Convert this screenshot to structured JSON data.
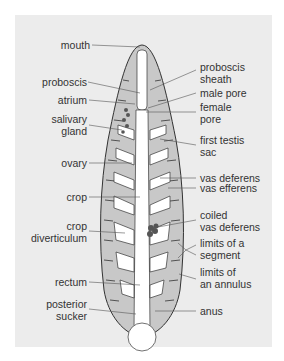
{
  "diagram": {
    "colors": {
      "background": "#ececec",
      "body": "#c8c8c8",
      "organs": "#ffffff",
      "outline": "#333333"
    },
    "left_labels": [
      {
        "id": "mouth",
        "line1": "mouth",
        "line2": ""
      },
      {
        "id": "proboscis",
        "line1": "proboscis",
        "line2": ""
      },
      {
        "id": "atrium",
        "line1": "atrium",
        "line2": ""
      },
      {
        "id": "salivary-gland",
        "line1": "salivary",
        "line2": "gland"
      },
      {
        "id": "ovary",
        "line1": "ovary",
        "line2": ""
      },
      {
        "id": "crop",
        "line1": "crop",
        "line2": ""
      },
      {
        "id": "crop-diverticulum",
        "line1": "crop",
        "line2": "diverticulum"
      },
      {
        "id": "rectum",
        "line1": "rectum",
        "line2": ""
      },
      {
        "id": "posterior-sucker",
        "line1": "posterior",
        "line2": "sucker"
      }
    ],
    "right_labels": [
      {
        "id": "proboscis-sheath",
        "line1": "proboscis",
        "line2": "sheath"
      },
      {
        "id": "male-pore",
        "line1": "male pore",
        "line2": ""
      },
      {
        "id": "female-pore",
        "line1": "female",
        "line2": "pore"
      },
      {
        "id": "first-testis-sac",
        "line1": "first testis",
        "line2": "sac"
      },
      {
        "id": "vas-deferens",
        "line1": "vas deferens",
        "line2": ""
      },
      {
        "id": "vas-efferens",
        "line1": "vas efferens",
        "line2": ""
      },
      {
        "id": "coiled-vas-deferens",
        "line1": "coiled",
        "line2": "vas deferens"
      },
      {
        "id": "limits-of-a-segment",
        "line1": "limits of a",
        "line2": "segment"
      },
      {
        "id": "limits-of-an-annulus",
        "line1": "limits of",
        "line2": "an annulus"
      },
      {
        "id": "anus",
        "line1": "anus",
        "line2": ""
      }
    ]
  }
}
